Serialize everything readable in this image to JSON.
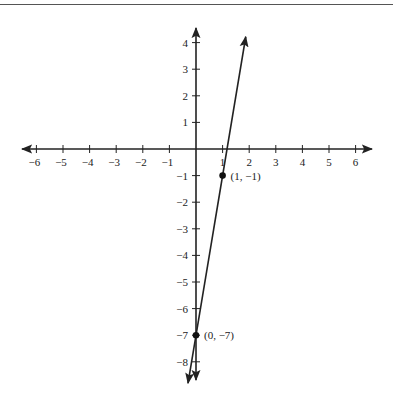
{
  "chart_data": {
    "type": "line",
    "title": "",
    "xlabel": "",
    "ylabel": "",
    "xlim": [
      -6,
      6
    ],
    "ylim": [
      -8,
      4
    ],
    "grid": false,
    "x_ticks": [
      -6,
      -5,
      -4,
      -3,
      -2,
      -1,
      1,
      2,
      3,
      4,
      5,
      6
    ],
    "x_tick_labels": [
      "−6",
      "−5",
      "−4",
      "−3",
      "−2",
      "−1",
      "1",
      "2",
      "3",
      "4",
      "5",
      "6"
    ],
    "y_ticks": [
      4,
      3,
      2,
      1,
      -1,
      -2,
      -3,
      -4,
      -5,
      -6,
      -7,
      -8
    ],
    "y_tick_labels": [
      "4",
      "3",
      "2",
      "1",
      "−1",
      "−2",
      "−3",
      "−4",
      "−5",
      "−6",
      "−7",
      "−8"
    ],
    "series": [
      {
        "name": "line",
        "equation": "y = 6x - 7",
        "slope": 6,
        "intercept": -7,
        "x": [
          -0.1667,
          1.8333
        ],
        "y": [
          -8,
          4
        ]
      }
    ],
    "points": [
      {
        "x": 1,
        "y": -1,
        "label": "(1, −1)"
      },
      {
        "x": 0,
        "y": -7,
        "label": "(0, −7)"
      }
    ]
  }
}
